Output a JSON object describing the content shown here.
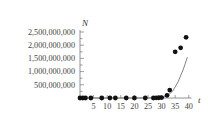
{
  "chart_data": {
    "type": "scatter",
    "title": "",
    "xlabel": "t",
    "ylabel": "N",
    "xlim": [
      0,
      41
    ],
    "ylim": [
      0,
      2500000000
    ],
    "grid": false,
    "legend": null,
    "x_ticks": [
      5,
      10,
      15,
      20,
      25,
      30,
      35,
      40
    ],
    "x_tick_labels": [
      "5",
      "10",
      "15",
      "20",
      "25",
      "30",
      "35",
      "40"
    ],
    "y_ticks": [
      500000000,
      1000000000,
      1500000000,
      2000000000,
      2500000000
    ],
    "y_tick_labels": [
      "500,000,000",
      "1,000,000,000",
      "1,500,000,000",
      "2,000,000,000",
      "2,500,000,000"
    ],
    "series": [
      {
        "name": "observed",
        "kind": "scatter",
        "x": [
          0,
          1,
          2,
          4,
          8,
          11,
          13,
          17,
          20,
          24,
          27,
          28,
          29,
          30,
          32,
          33,
          35,
          37,
          39
        ],
        "y": [
          0,
          0,
          0,
          0,
          0,
          0,
          0,
          0,
          0,
          0,
          0,
          5000000,
          10000000,
          15000000,
          100000000,
          300000000,
          1750000000,
          1900000000,
          2300000000
        ]
      },
      {
        "name": "model curve",
        "kind": "line",
        "x": [
          0,
          10,
          20,
          28,
          30,
          32,
          34,
          36,
          38,
          39.5
        ],
        "y": [
          0,
          0,
          0,
          5000000,
          20000000,
          80000000,
          250000000,
          600000000,
          1100000000,
          1550000000
        ]
      }
    ]
  }
}
